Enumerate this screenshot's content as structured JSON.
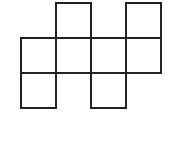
{
  "diagram": {
    "type": "cube-net",
    "cell_size": 35,
    "origin": [
      21,
      3
    ],
    "line_color": "#222222",
    "cells": [
      {
        "row": 0,
        "col": 1
      },
      {
        "row": 0,
        "col": 3
      },
      {
        "row": 1,
        "col": 0
      },
      {
        "row": 1,
        "col": 1
      },
      {
        "row": 1,
        "col": 2
      },
      {
        "row": 1,
        "col": 3
      },
      {
        "row": 2,
        "col": 0
      },
      {
        "row": 2,
        "col": 2
      }
    ]
  }
}
